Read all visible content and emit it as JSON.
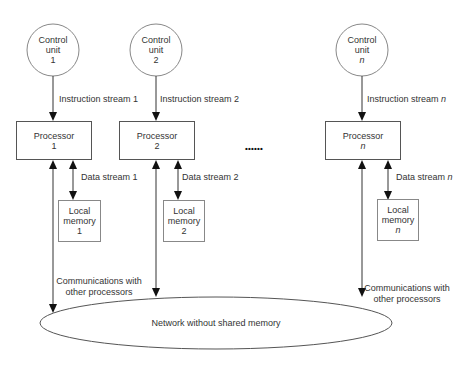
{
  "diagram": {
    "control_units": [
      {
        "line1": "Control",
        "line2": "unit",
        "index": "1",
        "italic": false
      },
      {
        "line1": "Control",
        "line2": "unit",
        "index": "2",
        "italic": false
      },
      {
        "line1": "Control",
        "line2": "unit",
        "index": "n",
        "italic": true
      }
    ],
    "instruction_streams": [
      {
        "label": "Instruction stream",
        "index": "1"
      },
      {
        "label": "Instruction stream",
        "index": "2"
      },
      {
        "label": "Instruction stream",
        "index": "n"
      }
    ],
    "processors": [
      {
        "label": "Processor",
        "index": "1"
      },
      {
        "label": "Processor",
        "index": "2"
      },
      {
        "label": "Processor",
        "index": "n"
      }
    ],
    "data_streams": [
      {
        "label": "Data stream",
        "index": "1"
      },
      {
        "label": "Data stream",
        "index": "2"
      },
      {
        "label": "Data stream",
        "index": "n"
      }
    ],
    "local_memories": [
      {
        "line1": "Local",
        "line2": "memory",
        "index": "1"
      },
      {
        "line1": "Local",
        "line2": "memory",
        "index": "2"
      },
      {
        "line1": "Local",
        "line2": "memory",
        "index": "n"
      }
    ],
    "ellipsis": "• • • • • •",
    "communications": [
      {
        "line1": "Communications with",
        "line2": "other processors"
      },
      {
        "line1": "Communications with",
        "line2": "other processors"
      }
    ],
    "network": {
      "label": "Network without shared memory"
    }
  }
}
